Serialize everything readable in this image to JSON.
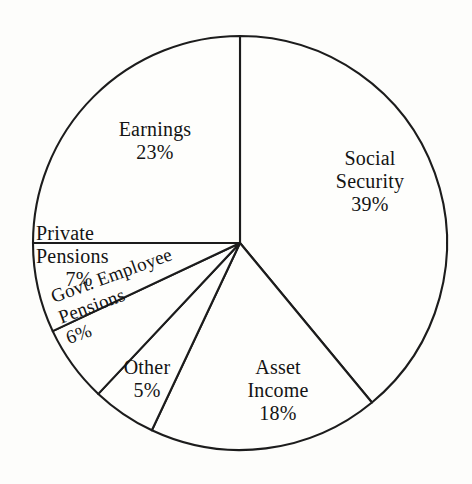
{
  "chart_data": {
    "type": "pie",
    "title": "",
    "subtitle": "",
    "xlabel": "",
    "ylabel": "",
    "legend": "none",
    "grid": false,
    "value_unit": "percent",
    "start_angle_deg": 0,
    "direction": "clockwise",
    "categories": [
      "Social Security",
      "Asset Income",
      "Other",
      "Govt. Employee Pensions",
      "Private Pensions",
      "Earnings"
    ],
    "values": [
      39,
      18,
      5,
      6,
      7,
      23
    ],
    "slices": [
      {
        "id": "social-security",
        "label": "Social Security",
        "label_lines": [
          "Social",
          "Security"
        ],
        "percent": 39,
        "percent_text": "39%",
        "start_deg": 0,
        "end_deg": 140.4,
        "fill": "#fefefc",
        "stroke": "#1c1c1c"
      },
      {
        "id": "asset-income",
        "label": "Asset Income",
        "label_lines": [
          "Asset",
          "Income"
        ],
        "percent": 18,
        "percent_text": "18%",
        "start_deg": 140.4,
        "end_deg": 205.2,
        "fill": "#fefefc",
        "stroke": "#1c1c1c"
      },
      {
        "id": "other",
        "label": "Other",
        "label_lines": [
          "Other"
        ],
        "percent": 5,
        "percent_text": "5%",
        "start_deg": 205.2,
        "end_deg": 223.2,
        "fill": "#fefefc",
        "stroke": "#1c1c1c"
      },
      {
        "id": "govt-employee-pensions",
        "label": "Govt. Employee Pensions",
        "label_lines": [
          "Govt. Employee",
          "Pensions"
        ],
        "percent": 6,
        "percent_text": "6%",
        "start_deg": 223.2,
        "end_deg": 244.8,
        "fill": "#fefefc",
        "stroke": "#1c1c1c"
      },
      {
        "id": "private-pensions",
        "label": "Private Pensions",
        "label_lines": [
          "Private",
          "Pensions"
        ],
        "percent": 7,
        "percent_text": "7%",
        "start_deg": 244.8,
        "end_deg": 270.0,
        "fill": "#fefefc",
        "stroke": "#1c1c1c"
      },
      {
        "id": "earnings",
        "label": "Earnings",
        "label_lines": [
          "Earnings"
        ],
        "percent": 23,
        "percent_text": "23%",
        "start_deg": 270.0,
        "end_deg": 360.0,
        "fill": "#fefefc",
        "stroke": "#1c1c1c"
      }
    ],
    "total_percent": 100
  },
  "geometry": {
    "center_x": 240,
    "center_y": 243,
    "radius": 207
  },
  "style": {
    "background": "#fdfdfb",
    "ink": "#1c1c1c",
    "slice_fill": "#fefefc"
  }
}
